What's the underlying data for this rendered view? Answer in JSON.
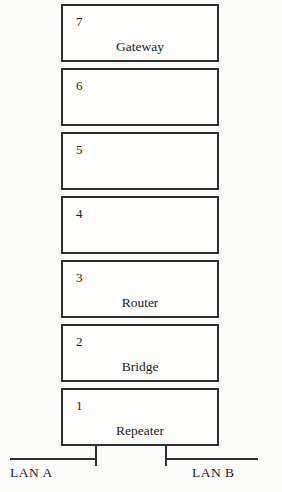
{
  "diagram": {
    "layers": [
      {
        "number": "7",
        "label": "Gateway"
      },
      {
        "number": "6",
        "label": ""
      },
      {
        "number": "5",
        "label": ""
      },
      {
        "number": "4",
        "label": ""
      },
      {
        "number": "3",
        "label": "Router"
      },
      {
        "number": "2",
        "label": "Bridge"
      },
      {
        "number": "1",
        "label": "Repeater"
      }
    ],
    "lan_a_label": "LAN A",
    "lan_b_label": "LAN B",
    "colors": {
      "line": "#2f2f2f",
      "text": "#222222",
      "background": "#fcfcfb"
    }
  }
}
